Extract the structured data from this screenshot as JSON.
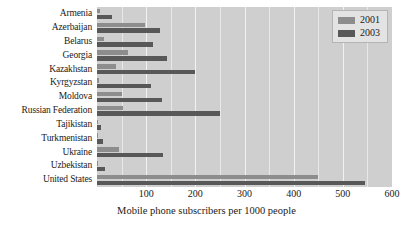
{
  "chart_data": {
    "type": "bar",
    "orientation": "horizontal",
    "title": "",
    "xlabel": "Mobile phone subscribers per 1000 people",
    "ylabel": "",
    "xlim": [
      0,
      600
    ],
    "xticks": [
      100,
      200,
      300,
      400,
      500,
      600
    ],
    "gridline_step": 50,
    "grid": true,
    "legend_position": "top-right",
    "categories": [
      "Armenia",
      "Azerbaijan",
      "Belarus",
      "Georgia",
      "Kazakhstan",
      "Kyrgyzstan",
      "Moldova",
      "Russian Federation",
      "Tajikistan",
      "Turkmenistan",
      "Ukraine",
      "Uzbekistan",
      "United States"
    ],
    "series": [
      {
        "name": "2001",
        "color": "#8d8d8d",
        "values": [
          7,
          97,
          15,
          63,
          38,
          5,
          51,
          52,
          1,
          2,
          45,
          3,
          450
        ]
      },
      {
        "name": "2003",
        "color": "#585858",
        "values": [
          30,
          128,
          113,
          143,
          200,
          109,
          132,
          250,
          8,
          13,
          135,
          16,
          545
        ]
      }
    ]
  },
  "legend": {
    "entries": [
      {
        "label": "2001"
      },
      {
        "label": "2003"
      }
    ]
  },
  "colors": {
    "series_2001": "#8d8d8d",
    "series_2003": "#585858",
    "plot_background": "#cfcfcf",
    "gridline": "#e8e8e8",
    "page_background": "#ffffff"
  }
}
